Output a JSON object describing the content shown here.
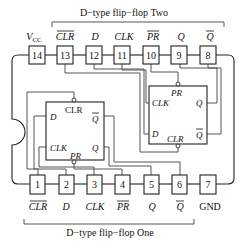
{
  "diagram": {
    "top_title": "D−type flip−flop Two",
    "bottom_title": "D−type flip−flop One",
    "top_pins": [
      {
        "num": "14",
        "label": "V",
        "sub": "CC",
        "overbar": false
      },
      {
        "num": "13",
        "label": "CLR",
        "overbar": true
      },
      {
        "num": "12",
        "label": "D",
        "overbar": false
      },
      {
        "num": "11",
        "label": "CLK",
        "overbar": false
      },
      {
        "num": "10",
        "label": "PR",
        "overbar": true
      },
      {
        "num": "9",
        "label": "Q",
        "overbar": false
      },
      {
        "num": "8",
        "label": "Q",
        "overbar": true
      }
    ],
    "bottom_pins": [
      {
        "num": "1",
        "label": "CLR",
        "overbar": true
      },
      {
        "num": "2",
        "label": "D",
        "overbar": false
      },
      {
        "num": "3",
        "label": "CLK",
        "overbar": false
      },
      {
        "num": "4",
        "label": "PR",
        "overbar": true
      },
      {
        "num": "5",
        "label": "Q",
        "overbar": false
      },
      {
        "num": "6",
        "label": "Q",
        "overbar": true
      },
      {
        "num": "7",
        "label": "GND",
        "overbar": false
      }
    ],
    "ff_one": {
      "top": "CLR",
      "bottom": "PR",
      "left_upper": "D",
      "left_lower": "CLK",
      "right_upper": "Q",
      "right_upper_overbar": true,
      "right_lower": "Q"
    },
    "ff_two": {
      "top": "PR",
      "bottom": "CLR",
      "left_upper": "CLK",
      "left_lower": "D",
      "right_upper": "Q",
      "right_lower": "Q",
      "right_lower_overbar": true
    }
  }
}
